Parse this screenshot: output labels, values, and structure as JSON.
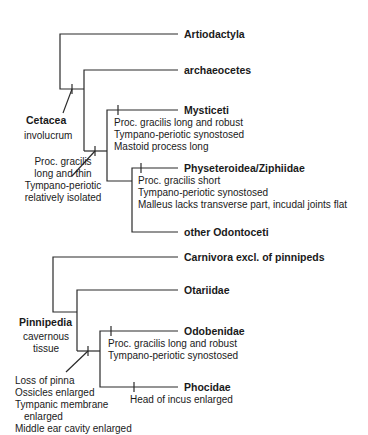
{
  "trees": [
    {
      "clade": "Cetacea",
      "clade_character": "involucrum",
      "root_character": [
        "Proc. gracilis",
        "long and thin",
        "Tympano-periotic",
        "relatively isolated"
      ],
      "taxa": [
        {
          "name": "Artiodactyla",
          "characters": []
        },
        {
          "name": "archaeocetes",
          "characters": []
        },
        {
          "name": "Mysticeti",
          "characters": [
            "Proc. gracilis long and robust",
            "Tympano-periotic synostosed",
            "Mastoid process long"
          ]
        },
        {
          "name": "Physeteroidea/Ziphiidae",
          "characters": [
            "Proc. gracilis short",
            "Tympano-periotic synostosed",
            "Malleus lacks transverse part, incudal joints flat"
          ]
        },
        {
          "name": "other Odontoceti",
          "characters": []
        }
      ]
    },
    {
      "clade": "Pinnipedia",
      "clade_character": [
        "cavernous",
        "tissue"
      ],
      "root_character": [
        "Loss of pinna",
        "Ossicles enlarged",
        "Tympanic membrane",
        "enlarged",
        "Middle ear cavity enlarged"
      ],
      "taxa": [
        {
          "name": "Carnivora excl. of pinnipeds",
          "characters": []
        },
        {
          "name": "Otariidae",
          "characters": []
        },
        {
          "name": "Odobenidae",
          "characters": [
            "Proc. gracilis long and robust",
            "Tympano-periotic synostosed"
          ]
        },
        {
          "name": "Phocidae",
          "characters": [
            "Head of incus enlarged"
          ]
        }
      ]
    }
  ],
  "colors": {
    "line": "#2a2a2a",
    "text": "#1a1a1a",
    "background": "#ffffff"
  }
}
